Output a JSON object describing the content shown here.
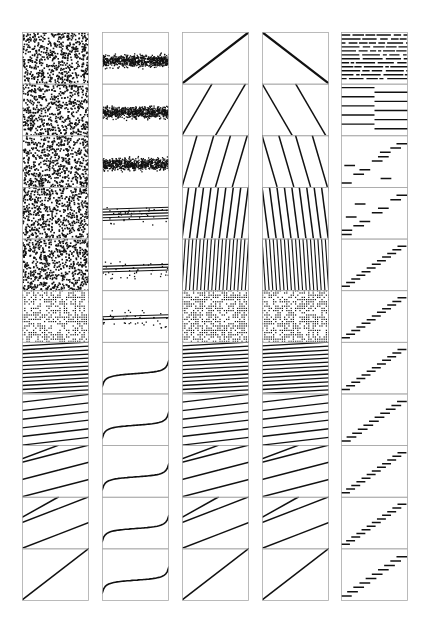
{
  "chart_data": {
    "type": "scatter",
    "title": "",
    "layout": {
      "columns": 5,
      "rows": 11,
      "grid": false,
      "legend": "none",
      "axis_ticks": "none",
      "frame_color": "#aaaaaa",
      "ink_color": "#111111"
    },
    "columns": [
      {
        "name": "column-1",
        "description": "uniform noise texture top rows, transitioning to dotted lattice, then stacked parallel lines, then few segments, then single diagonal",
        "rows": [
          {
            "kind": "noise",
            "density": 0.32
          },
          {
            "kind": "noise",
            "density": 0.32
          },
          {
            "kind": "noise",
            "density": 0.32
          },
          {
            "kind": "noise",
            "density": 0.32
          },
          {
            "kind": "noise",
            "density": 0.34
          },
          {
            "kind": "lattice",
            "density": 0.5
          },
          {
            "kind": "lines",
            "count": 13,
            "slope": 0.1
          },
          {
            "kind": "lines",
            "count": 6,
            "slope": 0.2
          },
          {
            "kind": "lines",
            "count": 3,
            "slope": 0.35,
            "bend": true
          },
          {
            "kind": "lines",
            "count": 2,
            "slope": 0.6,
            "bend": true
          },
          {
            "kind": "lines",
            "count": 1,
            "slope": 0.78
          }
        ]
      },
      {
        "name": "column-2",
        "description": "noisy horizontal bands collapsing into thin lines, then S-shaped (inverse sigmoid) curves",
        "rows": [
          {
            "kind": "band",
            "center": 0.55,
            "spread": 0.12
          },
          {
            "kind": "band",
            "center": 0.55,
            "spread": 0.12
          },
          {
            "kind": "band",
            "center": 0.55,
            "spread": 0.12
          },
          {
            "kind": "band_lines",
            "center": 0.55,
            "count": 5
          },
          {
            "kind": "band_lines",
            "center": 0.6,
            "count": 3
          },
          {
            "kind": "band_lines",
            "center": 0.55,
            "count": 2
          },
          {
            "kind": "scurve"
          },
          {
            "kind": "scurve"
          },
          {
            "kind": "scurve"
          },
          {
            "kind": "scurve"
          },
          {
            "kind": "scurve"
          }
        ]
      },
      {
        "name": "column-3",
        "description": "single rising diagonal splitting into progressively more steep parallel lines, dense grid in middle, then flatter stacked lines",
        "rows": [
          {
            "kind": "lines",
            "count": 1,
            "slope": 0.65,
            "thick": true
          },
          {
            "kind": "steep",
            "count": 2
          },
          {
            "kind": "steep",
            "count": 4
          },
          {
            "kind": "steep",
            "count": 9
          },
          {
            "kind": "steep",
            "count": 18
          },
          {
            "kind": "lattice",
            "density": 0.6
          },
          {
            "kind": "lines",
            "count": 13,
            "slope": 0.1
          },
          {
            "kind": "lines",
            "count": 6,
            "slope": 0.2
          },
          {
            "kind": "lines",
            "count": 3,
            "slope": 0.35,
            "bend": true
          },
          {
            "kind": "lines",
            "count": 2,
            "slope": 0.6,
            "bend": true
          },
          {
            "kind": "lines",
            "count": 1,
            "slope": 0.78
          }
        ]
      },
      {
        "name": "column-4",
        "description": "mirror of column 3 for top rows (descending lines), identical lower rows",
        "rows": [
          {
            "kind": "lines_desc",
            "count": 1,
            "thick": true
          },
          {
            "kind": "steep_desc",
            "count": 2
          },
          {
            "kind": "steep_desc",
            "count": 4
          },
          {
            "kind": "steep_desc",
            "count": 9
          },
          {
            "kind": "steep_desc",
            "count": 18
          },
          {
            "kind": "lattice",
            "density": 0.6
          },
          {
            "kind": "lines",
            "count": 13,
            "slope": 0.1
          },
          {
            "kind": "lines",
            "count": 6,
            "slope": 0.2
          },
          {
            "kind": "lines",
            "count": 3,
            "slope": 0.35,
            "bend": true
          },
          {
            "kind": "lines",
            "count": 2,
            "slope": 0.6,
            "bend": true
          },
          {
            "kind": "lines",
            "count": 1,
            "slope": 0.78
          }
        ]
      },
      {
        "name": "column-5",
        "description": "dashed horizontal rows at top, then two-segment bars, then staircase step functions",
        "rows": [
          {
            "kind": "dashes",
            "count": 12
          },
          {
            "kind": "halves",
            "count": 10
          },
          {
            "kind": "stairs",
            "count": 10,
            "scatter": true
          },
          {
            "kind": "stairs",
            "count": 10,
            "scatter": true
          },
          {
            "kind": "stairs",
            "count": 12
          },
          {
            "kind": "stairs",
            "count": 12
          },
          {
            "kind": "stairs",
            "count": 12
          },
          {
            "kind": "stairs",
            "count": 11
          },
          {
            "kind": "stairs",
            "count": 12
          },
          {
            "kind": "stairs",
            "count": 12
          },
          {
            "kind": "stairs",
            "count": 10
          }
        ]
      }
    ],
    "geometry": {
      "column_x": [
        22,
        102,
        182,
        262,
        341
      ],
      "column_width": 67,
      "top": 32,
      "bottom": 600
    }
  }
}
